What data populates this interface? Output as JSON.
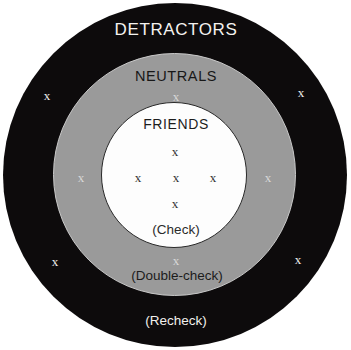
{
  "diagram": {
    "type": "concentric-circles-bullseye",
    "title_visible": false,
    "zones": [
      {
        "id": "detractors",
        "label": "DETRACTORS",
        "action_label": "(Recheck)",
        "fill_color": "#0d0b0c",
        "text_color": "#f4f2ef",
        "marker_count": 4
      },
      {
        "id": "neutrals",
        "label": "NEUTRALS",
        "action_label": "(Double-check)",
        "fill_color": "#9a9a9a",
        "text_color": "#171717",
        "marker_count": 4
      },
      {
        "id": "friends",
        "label": "FRIENDS",
        "action_label": "(Check)",
        "fill_color": "#fdfdfd",
        "text_color": "#1d1d1d",
        "marker_count": 5
      }
    ],
    "markers": [
      {
        "id": "m1",
        "symbol": "x",
        "zone": "detractors",
        "x": 47,
        "y": 95
      },
      {
        "id": "m2",
        "symbol": "x",
        "zone": "detractors",
        "x": 301,
        "y": 92
      },
      {
        "id": "m3",
        "symbol": "x",
        "zone": "detractors",
        "x": 55,
        "y": 261
      },
      {
        "id": "m4",
        "symbol": "x",
        "zone": "detractors",
        "x": 298,
        "y": 259
      },
      {
        "id": "m5",
        "symbol": "x",
        "zone": "neutrals",
        "x": 176,
        "y": 96
      },
      {
        "id": "m6",
        "symbol": "x",
        "zone": "neutrals",
        "x": 81,
        "y": 177
      },
      {
        "id": "m7",
        "symbol": "x",
        "zone": "neutrals",
        "x": 268,
        "y": 177
      },
      {
        "id": "m8",
        "symbol": "x",
        "zone": "neutrals",
        "x": 176,
        "y": 260
      },
      {
        "id": "m9",
        "symbol": "x",
        "zone": "friends",
        "x": 175,
        "y": 151
      },
      {
        "id": "m10",
        "symbol": "x",
        "zone": "friends",
        "x": 138,
        "y": 177
      },
      {
        "id": "m11",
        "symbol": "x",
        "zone": "friends",
        "x": 176,
        "y": 177
      },
      {
        "id": "m12",
        "symbol": "x",
        "zone": "friends",
        "x": 213,
        "y": 177
      },
      {
        "id": "m13",
        "symbol": "x",
        "zone": "friends",
        "x": 175,
        "y": 203
      }
    ]
  }
}
